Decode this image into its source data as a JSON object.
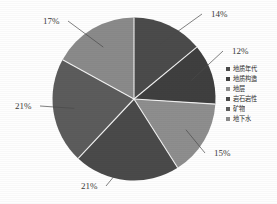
{
  "chart_data": {
    "type": "pie",
    "title": "",
    "subtitle": "",
    "xlabel": "",
    "ylabel": "",
    "legend_position": "right",
    "grid": false,
    "unit": "%",
    "start_angle_deg": 0,
    "direction": "clockwise",
    "categories": [
      "地质年代",
      "地质构造",
      "地层",
      "岩石岩性",
      "矿物",
      "地下水"
    ],
    "values": [
      14,
      12,
      15,
      21,
      21,
      17
    ],
    "labels": [
      "14%",
      "12%",
      "15%",
      "21%",
      "21%",
      "17%"
    ],
    "colors": [
      "#4b4b4b",
      "#3f3f3f",
      "#8e8e8e",
      "#4a4a4a",
      "#5c5c5c",
      "#8a8a8a"
    ],
    "slices": [
      {
        "name": "地质年代",
        "value": 14,
        "label": "14%",
        "color": "#4b4b4b"
      },
      {
        "name": "地质构造",
        "value": 12,
        "label": "12%",
        "color": "#3f3f3f"
      },
      {
        "name": "地层",
        "value": 15,
        "label": "15%",
        "color": "#8e8e8e"
      },
      {
        "name": "岩石岩性",
        "value": 21,
        "label": "21%",
        "color": "#4a4a4a"
      },
      {
        "name": "矿物",
        "value": 21,
        "label": "21%",
        "color": "#5c5c5c"
      },
      {
        "name": "地下水",
        "value": 17,
        "label": "17%",
        "color": "#8a8a8a"
      }
    ]
  },
  "legend": {
    "items": [
      {
        "label": "地质年代",
        "color": "#4b4b4b"
      },
      {
        "label": "地质构造",
        "color": "#3f3f3f"
      },
      {
        "label": "地层",
        "color": "#8e8e8e"
      },
      {
        "label": "岩石岩性",
        "color": "#4a4a4a"
      },
      {
        "label": "矿物",
        "color": "#5c5c5c"
      },
      {
        "label": "地下水",
        "color": "#8a8a8a"
      }
    ]
  },
  "callouts": [
    {
      "text": "14%",
      "x": 211,
      "y": 17
    },
    {
      "text": "12%",
      "x": 232,
      "y": 54
    },
    {
      "text": "15%",
      "x": 214,
      "y": 156
    },
    {
      "text": "21%",
      "x": 81,
      "y": 189
    },
    {
      "text": "21%",
      "x": 15,
      "y": 109
    },
    {
      "text": "17%",
      "x": 43,
      "y": 24
    }
  ]
}
